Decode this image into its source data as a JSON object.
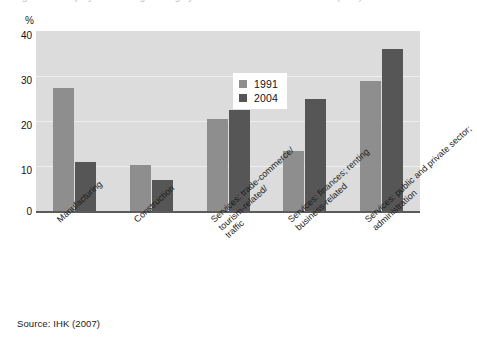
{
  "caption": {
    "cut_off_text": "Figure 4.3  Employment in Regensburg by economic sector 1991 and 2004 (in %)"
  },
  "source": {
    "text": "Source: IHK (2007)"
  },
  "legend": {
    "items": [
      {
        "label": "1991",
        "color": "#8e8e8e"
      },
      {
        "label": "2004",
        "color": "#565656"
      }
    ]
  },
  "axis": {
    "y_unit": "%",
    "y_ticks": [
      "0",
      "10",
      "20",
      "30",
      "40"
    ]
  },
  "categories_display": [
    {
      "lines": [
        "Manufacturing"
      ]
    },
    {
      "lines": [
        "Construction"
      ]
    },
    {
      "lines": [
        "Services: trade-commerce/",
        "tourism-related/",
        "traffic"
      ]
    },
    {
      "lines": [
        "Services: finances; renting",
        "business-related"
      ]
    },
    {
      "lines": [
        "Services: public and private sector;",
        "administration"
      ]
    }
  ],
  "chart_data": {
    "type": "bar",
    "title": "",
    "subtitle": "",
    "xlabel": "",
    "ylabel": "%",
    "ylim": [
      0,
      40
    ],
    "yticks": [
      0,
      10,
      20,
      30,
      40
    ],
    "grid": true,
    "legend_position": "top-center-inside",
    "categories": [
      "Manufacturing",
      "Construction",
      "Services: trade-commerce/ tourism-related/ traffic",
      "Services: finances; renting business-related",
      "Services: public and private sector; administration"
    ],
    "series": [
      {
        "name": "1991",
        "color": "#8e8e8e",
        "values": [
          27.5,
          10.5,
          20.5,
          13.5,
          29.0
        ]
      },
      {
        "name": "2004",
        "color": "#565656",
        "values": [
          11.0,
          7.0,
          22.5,
          25.0,
          36.0
        ]
      }
    ]
  }
}
